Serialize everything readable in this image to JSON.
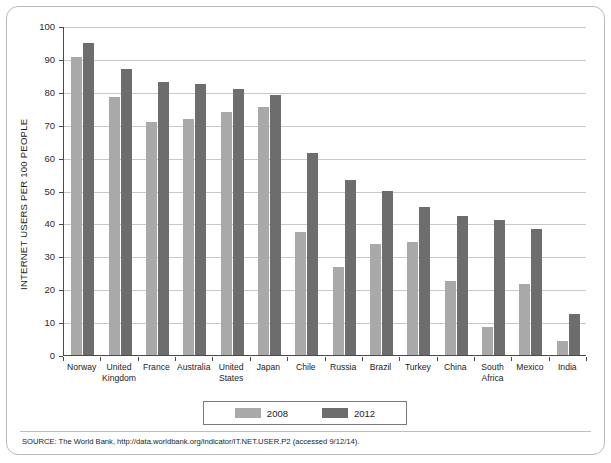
{
  "chart_data": {
    "type": "bar",
    "title": "",
    "subtitle": "",
    "xlabel": "",
    "ylabel": "INTERNET USERS PER 100 PEOPLE",
    "ylim": [
      0,
      100
    ],
    "ytick_step": 10,
    "yticks": [
      0,
      10,
      20,
      30,
      40,
      50,
      60,
      70,
      80,
      90,
      100
    ],
    "grid": true,
    "legend_position": "bottom-center",
    "categories": [
      "Norway",
      "United Kingdom",
      "France",
      "Australia",
      "United States",
      "Japan",
      "Chile",
      "Russia",
      "Brazil",
      "Turkey",
      "China",
      "South Africa",
      "Mexico",
      "India"
    ],
    "series": [
      {
        "name": "2008",
        "color": "#a9a9a9",
        "values": [
          90.5,
          78.4,
          70.7,
          71.7,
          74.0,
          75.4,
          37.3,
          26.8,
          33.8,
          34.4,
          22.6,
          8.4,
          21.6,
          4.4
        ]
      },
      {
        "name": "2012",
        "color": "#6d6d6d",
        "values": [
          94.8,
          87.0,
          83.0,
          82.3,
          81.0,
          79.1,
          61.4,
          53.3,
          49.8,
          45.1,
          42.3,
          41.0,
          38.4,
          12.6
        ]
      }
    ]
  },
  "source": {
    "text": "SOURCE: The World Bank, http://data.worldbank.org/indicator/IT.NET.USER.P2 (accessed 9/12/14)."
  },
  "colors": {
    "series_2008": "#a9a9a9",
    "series_2012": "#6d6d6d",
    "axis": "#4a4a4a",
    "grid": "#c9c9c9",
    "frame_border": "#b9b9b9",
    "background": "#ffffff"
  }
}
